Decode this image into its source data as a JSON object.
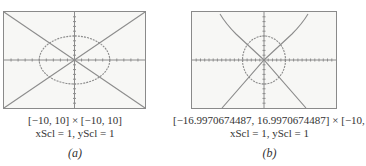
{
  "figures": [
    {
      "id": "a",
      "window": "[−10, 10] × [−10, 10]",
      "scale": "xScl = 1, yScl = 1",
      "label": "(a)",
      "xmin": -10,
      "xmax": 10,
      "ymin": -10,
      "ymax": 10,
      "xscl": 1,
      "yscl": 1
    },
    {
      "id": "b",
      "window": "[−16.9970674487, 16.9970674487] × [−10, 10]",
      "scale": "xScl = 1, yScl = 1",
      "label": "(b)",
      "xmin": -16.9970674487,
      "xmax": 16.9970674487,
      "ymin": -10,
      "ymax": 10,
      "xscl": 1,
      "yscl": 1
    }
  ],
  "graphs": {
    "circle_radius": 5,
    "curves": [
      "x² + y² = 25",
      "y = x",
      "y = −x"
    ]
  },
  "colors": {
    "frame": "#8a8a8a",
    "plot": "#8c8c8c",
    "background": "#f7f7f5"
  }
}
